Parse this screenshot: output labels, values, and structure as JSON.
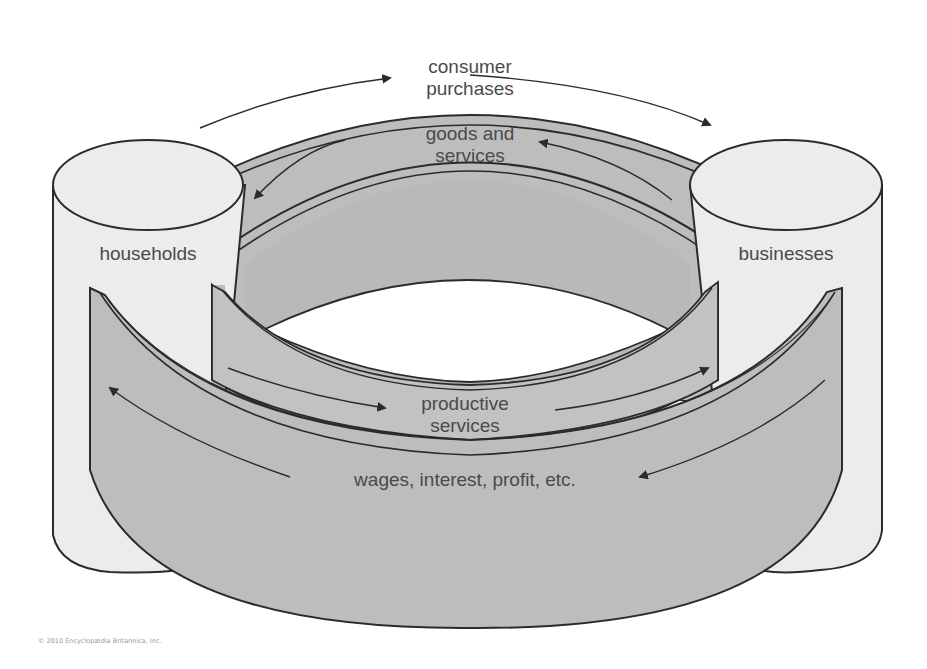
{
  "diagram": {
    "nodes": {
      "households": "households",
      "businesses": "businesses"
    },
    "flows": {
      "consumer_purchases": {
        "line1": "consumer",
        "line2": "purchases",
        "from": "households",
        "to": "businesses"
      },
      "goods_services": {
        "line1": "goods and",
        "line2": "services",
        "from": "businesses",
        "to": "households"
      },
      "productive_services": {
        "line1": "productive",
        "line2": "services",
        "from": "households",
        "to": "businesses"
      },
      "wages": {
        "line1": "wages, interest, profit, etc.",
        "from": "businesses",
        "to": "households"
      }
    },
    "credit": "© 2010 Encyclopædia Britannica, Inc.",
    "colors": {
      "cylinder": "#ececec",
      "band": "#bdbdbd",
      "band_inner": "#c6c6c6",
      "stroke": "#2b2b2b",
      "text": "#4a4a4a",
      "background": "#ffffff"
    }
  }
}
